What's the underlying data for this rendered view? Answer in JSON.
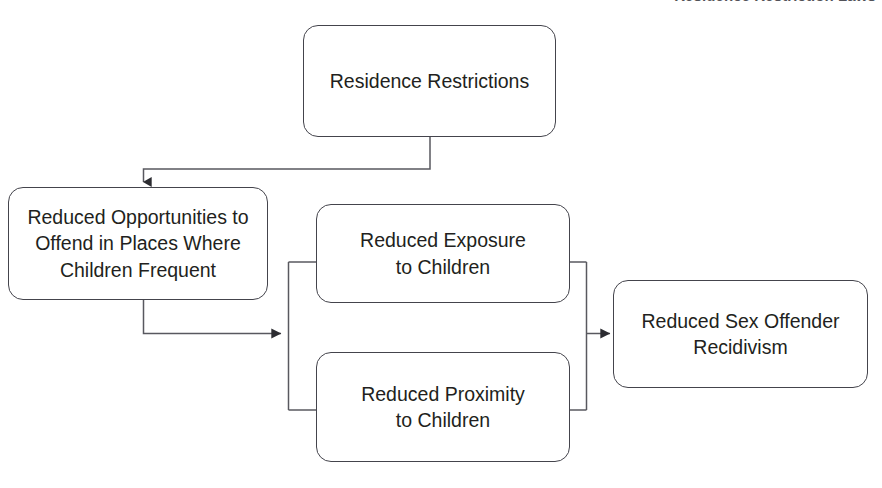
{
  "page": {
    "width": 882,
    "height": 488,
    "background_color": "#ffffff",
    "cropped_top_caption": "Residence Restriction Laws"
  },
  "diagram": {
    "type": "flowchart",
    "orientation": "left-to-right",
    "node_style": {
      "shape": "rounded-rectangle",
      "fill_color": "#ffffff",
      "border_color": "#44444c",
      "text_color": "#221f20"
    },
    "connector_style": {
      "line_color": "#58585f",
      "arrowhead": "solid-triangle",
      "routing": "orthogonal-elbow"
    },
    "nodes": [
      {
        "id": "residence-restrictions",
        "label": "Residence Restrictions",
        "lines": [
          "Residence Restrictions"
        ]
      },
      {
        "id": "reduced-opportunities",
        "label": "Reduced Opportunities to Offend in Places Where Children Frequent",
        "lines": [
          "Reduced Opportunities to",
          "Offend in Places Where",
          "Children Frequent"
        ]
      },
      {
        "id": "reduced-exposure",
        "label": "Reduced Exposure to Children",
        "lines": [
          "Reduced Exposure",
          "to Children"
        ]
      },
      {
        "id": "reduced-proximity",
        "label": "Reduced Proximity to Children",
        "lines": [
          "Reduced Proximity",
          "to Children"
        ]
      },
      {
        "id": "reduced-recidivism",
        "label": "Reduced Sex Offender Recidivism",
        "lines": [
          "Reduced Sex Offender",
          "Recidivism"
        ]
      }
    ],
    "edges": [
      {
        "id": "edge-restrictions-to-opportunities",
        "from": "residence-restrictions",
        "to": "reduced-opportunities",
        "arrow": true
      },
      {
        "id": "edge-opportunities-to-mechanisms",
        "from": "reduced-opportunities",
        "to": "mechanisms-bracket",
        "arrow": true
      },
      {
        "id": "edge-bracket-to-exposure",
        "from": "mechanisms-bracket",
        "to": "reduced-exposure",
        "arrow": false
      },
      {
        "id": "edge-bracket-to-proximity",
        "from": "mechanisms-bracket",
        "to": "reduced-proximity",
        "arrow": false
      },
      {
        "id": "edge-exposure-to-join",
        "from": "reduced-exposure",
        "to": "outcome-bracket",
        "arrow": false
      },
      {
        "id": "edge-proximity-to-join",
        "from": "reduced-proximity",
        "to": "outcome-bracket",
        "arrow": false
      },
      {
        "id": "edge-join-to-recidivism",
        "from": "outcome-bracket",
        "to": "reduced-recidivism",
        "arrow": true
      }
    ]
  }
}
